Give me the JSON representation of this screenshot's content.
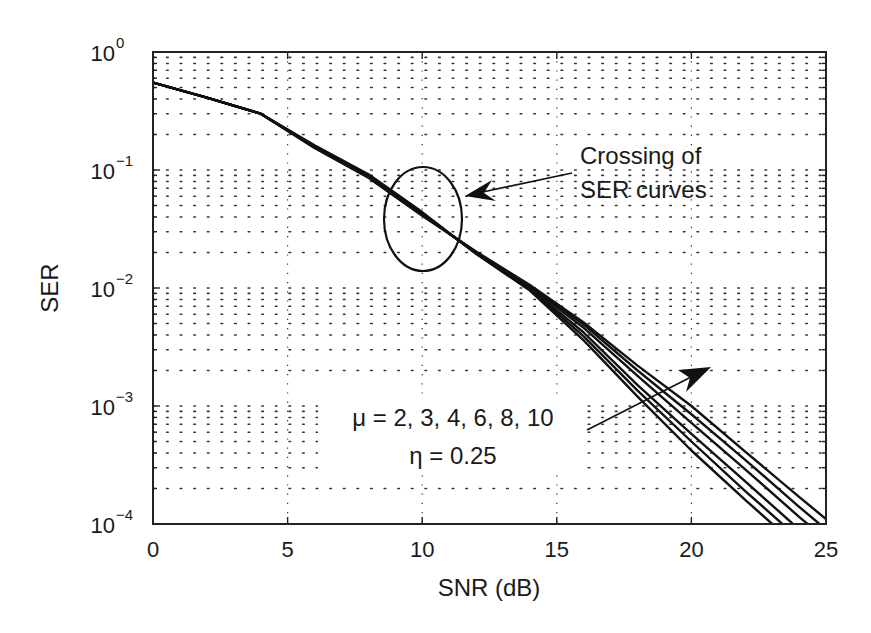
{
  "chart_data": {
    "type": "line",
    "title": "",
    "xlabel": "SNR (dB)",
    "ylabel": "SER",
    "xlim": [
      0,
      25
    ],
    "ylim": [
      0.0001,
      1
    ],
    "yscale": "log",
    "grid": true,
    "x_ticks": [
      "0",
      "5",
      "10",
      "15",
      "20",
      "25"
    ],
    "y_ticks": [
      {
        "base": "10",
        "exp": "0"
      },
      {
        "base": "10",
        "exp": "−1"
      },
      {
        "base": "10",
        "exp": "−2"
      },
      {
        "base": "10",
        "exp": "−3"
      },
      {
        "base": "10",
        "exp": "−4"
      }
    ],
    "x": [
      0,
      2,
      4,
      6,
      8,
      10,
      12,
      14,
      16,
      18,
      20,
      22,
      24,
      25
    ],
    "series": [
      {
        "name": "mu = 2",
        "values": [
          0.55,
          0.41,
          0.3,
          0.162,
          0.092,
          0.044,
          0.0195,
          0.0095,
          0.0036,
          0.0012,
          0.00042,
          0.00016,
          6.3e-05,
          4e-05
        ]
      },
      {
        "name": "mu = 3",
        "values": [
          0.55,
          0.41,
          0.3,
          0.16,
          0.09,
          0.043,
          0.0196,
          0.0097,
          0.0039,
          0.00135,
          0.0005,
          0.00019,
          7.5e-05,
          4.8e-05
        ]
      },
      {
        "name": "mu = 4",
        "values": [
          0.55,
          0.41,
          0.3,
          0.158,
          0.089,
          0.0425,
          0.0198,
          0.0099,
          0.0042,
          0.0015,
          0.00058,
          0.00023,
          9e-05,
          5.8e-05
        ]
      },
      {
        "name": "mu = 6",
        "values": [
          0.55,
          0.41,
          0.3,
          0.156,
          0.088,
          0.042,
          0.02,
          0.0102,
          0.0046,
          0.0018,
          0.00072,
          0.00029,
          0.000115,
          7.4e-05
        ]
      },
      {
        "name": "mu = 8",
        "values": [
          0.55,
          0.41,
          0.3,
          0.155,
          0.087,
          0.0415,
          0.0202,
          0.0104,
          0.0049,
          0.002,
          0.00085,
          0.00035,
          0.00014,
          9e-05
        ]
      },
      {
        "name": "mu = 10",
        "values": [
          0.55,
          0.41,
          0.3,
          0.154,
          0.086,
          0.041,
          0.0204,
          0.0106,
          0.0051,
          0.0022,
          0.001,
          0.00041,
          0.00017,
          0.00011
        ]
      }
    ],
    "annotations": [
      {
        "text": [
          "Crossing of",
          "SER curves"
        ],
        "type": "ellipse-with-arrow",
        "target_snr_db": 10,
        "target_ser": 0.04
      },
      {
        "text": [
          "μ = 2, 3, 4, 6, 8, 10",
          "η = 0.25"
        ],
        "type": "arrow",
        "direction": "increasing mu"
      }
    ]
  },
  "labels": {
    "xlabel": "SNR (dB)",
    "ylabel": "SER",
    "crossing_line1": "Crossing of",
    "crossing_line2": "SER curves",
    "mu_label": "μ = 2, 3, 4, 6, 8, 10",
    "eta_label": "η = 0.25"
  },
  "style": {
    "line_color": "#111111",
    "grid_color": "#333333",
    "background": "#ffffff"
  }
}
